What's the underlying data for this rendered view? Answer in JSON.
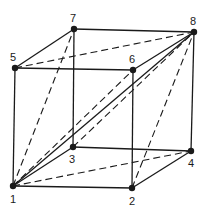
{
  "diagram": {
    "nodes": [
      {
        "id": "1",
        "x": 13,
        "y": 186,
        "label": "1",
        "lx": 10,
        "ly": 203
      },
      {
        "id": "2",
        "x": 132,
        "y": 188,
        "label": "2",
        "lx": 129,
        "ly": 205
      },
      {
        "id": "3",
        "x": 73,
        "y": 147,
        "label": "3",
        "lx": 69,
        "ly": 163
      },
      {
        "id": "4",
        "x": 191,
        "y": 151,
        "label": "4",
        "lx": 188,
        "ly": 167
      },
      {
        "id": "5",
        "x": 15,
        "y": 68,
        "label": "5",
        "lx": 10,
        "ly": 61
      },
      {
        "id": "6",
        "x": 133,
        "y": 70,
        "label": "6",
        "lx": 129,
        "ly": 63
      },
      {
        "id": "7",
        "x": 74,
        "y": 29,
        "label": "7",
        "lx": 70,
        "ly": 22
      },
      {
        "id": "8",
        "x": 194,
        "y": 32,
        "label": "8",
        "lx": 190,
        "ly": 25
      }
    ],
    "solid_edges": [
      [
        "1",
        "2"
      ],
      [
        "1",
        "5"
      ],
      [
        "5",
        "6"
      ],
      [
        "5",
        "7"
      ],
      [
        "7",
        "8"
      ],
      [
        "6",
        "8"
      ],
      [
        "2",
        "6"
      ],
      [
        "2",
        "4"
      ],
      [
        "4",
        "8"
      ],
      [
        "7",
        "3"
      ],
      [
        "3",
        "4"
      ],
      [
        "1",
        "3"
      ],
      [
        "1",
        "8"
      ]
    ],
    "dashed_edges": [
      [
        "1",
        "7"
      ],
      [
        "5",
        "8"
      ],
      [
        "1",
        "6"
      ],
      [
        "3",
        "8"
      ],
      [
        "1",
        "4"
      ],
      [
        "2",
        "8"
      ]
    ],
    "colors": {
      "stroke": "#1a1a1a",
      "background": "#ffffff"
    }
  }
}
